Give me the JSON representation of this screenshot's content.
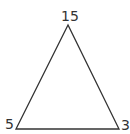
{
  "diagram": {
    "type": "triangle",
    "stroke_color": "#333333",
    "label_color": "#333333",
    "vertices": [
      {
        "id": "top",
        "label": "15",
        "x": 68,
        "y": 25
      },
      {
        "id": "bottom-left",
        "label": "5",
        "x": 16,
        "y": 129
      },
      {
        "id": "bottom-right",
        "label": "3",
        "x": 119,
        "y": 129
      }
    ]
  }
}
